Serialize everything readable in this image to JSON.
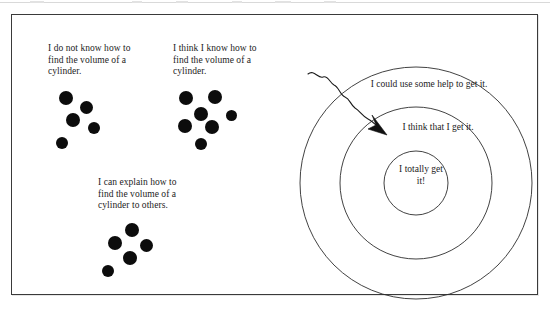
{
  "figure": {
    "ink_color": "#0c0c0c",
    "frame_color": "#3a3a3a",
    "background_color": "#ffffff"
  },
  "clusters": [
    {
      "id": "novice",
      "caption": "I do not know how to\nfind the volume of a\ncylinder.",
      "dot_count": 5,
      "dots": [
        {
          "x": 8,
          "y": 2,
          "d": 14
        },
        {
          "x": 29,
          "y": 12,
          "d": 13
        },
        {
          "x": 15,
          "y": 24,
          "d": 14
        },
        {
          "x": 37,
          "y": 33,
          "d": 12
        },
        {
          "x": 5,
          "y": 48,
          "d": 12
        }
      ]
    },
    {
      "id": "developing",
      "caption": "I think I know how to\nfind the volume of a\ncylinder.",
      "dot_count": 7,
      "dots": [
        {
          "x": 4,
          "y": 2,
          "d": 14
        },
        {
          "x": 33,
          "y": 1,
          "d": 14
        },
        {
          "x": 19,
          "y": 18,
          "d": 14
        },
        {
          "x": 51,
          "y": 21,
          "d": 11
        },
        {
          "x": 3,
          "y": 30,
          "d": 14
        },
        {
          "x": 30,
          "y": 31,
          "d": 14
        },
        {
          "x": 20,
          "y": 49,
          "d": 12
        }
      ]
    },
    {
      "id": "expert",
      "caption": "I can explain how to\nfind the volume of a\ncylinder to others.",
      "dot_count": 5,
      "dots": [
        {
          "x": 24,
          "y": 0,
          "d": 14
        },
        {
          "x": 7,
          "y": 13,
          "d": 14
        },
        {
          "x": 39,
          "y": 16,
          "d": 13
        },
        {
          "x": 22,
          "y": 28,
          "d": 14
        },
        {
          "x": 1,
          "y": 42,
          "d": 12
        }
      ]
    }
  ],
  "rings": {
    "outer_label": "I could use some help to get it.",
    "middle_label": "I think that I get it.",
    "inner_label": "I totally get\nit!",
    "arrow_name": "squiggly-arrow"
  }
}
